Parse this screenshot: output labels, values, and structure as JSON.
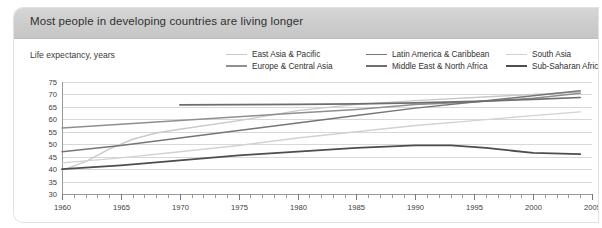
{
  "card": {
    "title": "Most people in developing countries are living longer",
    "footer": "World Bank estimates",
    "axis_caption": "Life expectancy, years",
    "header_bg": "#cccccc"
  },
  "chart_data": {
    "type": "line",
    "title": "Most people in developing countries are living longer",
    "subtitle": "Life expectancy, years",
    "source": "World Bank estimates",
    "xlabel": "",
    "ylabel": "Life expectancy, years",
    "xlim": [
      1960,
      2005
    ],
    "ylim": [
      30,
      75
    ],
    "ytick_step": 5,
    "xtick_step": 5,
    "x_minor_tick_step": 1,
    "yticks": [
      "30",
      "35",
      "40",
      "45",
      "50",
      "55",
      "60",
      "65",
      "70",
      "75"
    ],
    "xticks": [
      "1960",
      "1965",
      "1970",
      "1975",
      "1980",
      "1985",
      "1990",
      "1995",
      "2000",
      "2005"
    ],
    "grid": "horizontal",
    "legend_position": "top-right",
    "series": [
      {
        "name": "East Asia & Pacific",
        "color": "#c9c9c9",
        "width": 1.4,
        "x": [
          1960,
          1962,
          1964,
          1966,
          1968,
          1970,
          1975,
          1980,
          1985,
          1990,
          1995,
          2000,
          2004
        ],
        "values": [
          39.5,
          43.0,
          48.0,
          52.0,
          54.5,
          56.0,
          59.5,
          63.5,
          66.0,
          67.5,
          68.8,
          70.0,
          71.0
        ]
      },
      {
        "name": "Europe & Central Asia",
        "color": "#8f8f8f",
        "width": 1.5,
        "x": [
          1960,
          1965,
          1970,
          1975,
          1980,
          1985,
          1990,
          1995,
          2000,
          2004
        ],
        "values": [
          56.5,
          58.0,
          59.5,
          61.0,
          62.5,
          64.0,
          66.0,
          67.0,
          68.5,
          70.5
        ]
      },
      {
        "name": "Latin America & Caribbean",
        "color": "#767676",
        "width": 1.5,
        "x": [
          1960,
          1965,
          1970,
          1975,
          1980,
          1985,
          1990,
          1995,
          2000,
          2004
        ],
        "values": [
          47.0,
          49.5,
          52.5,
          55.5,
          58.5,
          61.5,
          64.5,
          67.0,
          69.5,
          71.5
        ]
      },
      {
        "name": "Middle East & North Africa",
        "color": "#6e6e6e",
        "width": 1.6,
        "x": [
          1970,
          1975,
          1980,
          1985,
          1990,
          1995,
          2000,
          2004
        ],
        "values": [
          65.8,
          65.9,
          66.0,
          66.2,
          66.6,
          67.2,
          68.0,
          68.8
        ]
      },
      {
        "name": "South Asia",
        "color": "#d2d2d2",
        "width": 1.4,
        "x": [
          1960,
          1965,
          1970,
          1975,
          1980,
          1985,
          1990,
          1995,
          2000,
          2004
        ],
        "values": [
          42.5,
          44.5,
          47.0,
          49.5,
          52.5,
          55.0,
          57.5,
          59.5,
          61.5,
          63.0
        ]
      },
      {
        "name": "Sub-Saharan Africa",
        "color": "#4d4d4d",
        "width": 1.8,
        "x": [
          1960,
          1965,
          1970,
          1975,
          1980,
          1985,
          1990,
          1993,
          1996,
          2000,
          2004
        ],
        "values": [
          40.0,
          41.5,
          43.5,
          45.5,
          47.0,
          48.5,
          49.5,
          49.5,
          48.5,
          46.5,
          46.0
        ]
      }
    ]
  },
  "legend": {
    "rows": [
      [
        {
          "label": "East Asia & Pacific",
          "color": "#c9c9c9",
          "width": 1.6
        },
        {
          "label": "Latin America & Caribbean",
          "color": "#767676",
          "width": 1.6
        },
        {
          "label": "South Asia",
          "color": "#d2d2d2",
          "width": 1.6
        }
      ],
      [
        {
          "label": "Europe & Central Asia",
          "color": "#8f8f8f",
          "width": 2.0
        },
        {
          "label": "Middle East & North Africa",
          "color": "#6e6e6e",
          "width": 2.0
        },
        {
          "label": "Sub-Saharan Africa",
          "color": "#4d4d4d",
          "width": 2.2
        }
      ]
    ]
  }
}
